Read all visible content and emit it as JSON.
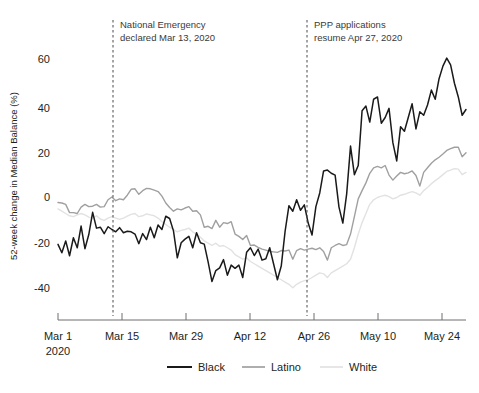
{
  "chart_data": {
    "type": "line",
    "title": "",
    "xlabel": "",
    "ylabel": "52-week change in Median Balance (%)",
    "ylim": [
      -45,
      68
    ],
    "yticks": [
      -40,
      -20,
      0,
      20,
      40,
      60
    ],
    "ytick_labels": [
      "-40",
      "-20",
      "0",
      "20",
      "40",
      "60"
    ],
    "xticks": [
      "Mar 1",
      "Mar 15",
      "Mar 29",
      "Apr 12",
      "Apr 26",
      "May 10",
      "May 24"
    ],
    "xtick_sublabel": "2020",
    "grid": false,
    "legend_position": "bottom",
    "x_start_date": "2020-03-01",
    "x_end_date": "2020-05-31",
    "annotations": [
      {
        "name": "national-emergency",
        "line1": "National Emergency",
        "line2": "declared Mar 13, 2020",
        "date": "2020-03-13"
      },
      {
        "name": "ppp-applications",
        "line1": "PPP applications",
        "line2": "resume Apr 27, 2020",
        "date": "2020-04-27"
      }
    ],
    "series": [
      {
        "name": "Black",
        "color": "#1a1a1a",
        "width": 1.5,
        "values": [
          -20.5,
          -24.2,
          -19.0,
          -25.5,
          -17.6,
          -22.0,
          -12.5,
          -22.4,
          -16.2,
          -6.5,
          -13.4,
          -13.0,
          -15.8,
          -12.8,
          -14.0,
          -15.0,
          -13.2,
          -15.4,
          -14.8,
          -15.0,
          -16.0,
          -20.2,
          -15.8,
          -18.4,
          -13.0,
          -17.6,
          -12.0,
          -14.0,
          -8.2,
          -9.2,
          -14.6,
          -26.4,
          -19.8,
          -18.2,
          -17.0,
          -22.0,
          -15.4,
          -19.8,
          -20.4,
          -28.2,
          -36.8,
          -32.0,
          -30.8,
          -27.2,
          -34.0,
          -29.6,
          -31.0,
          -29.6,
          -35.0,
          -24.0,
          -22.0,
          -25.4,
          -22.6,
          -27.4,
          -26.8,
          -22.0,
          -29.0,
          -36.0,
          -30.0,
          -14.8,
          -3.6,
          -6.0,
          -1.0,
          -5.6,
          -3.2,
          -11.2,
          -16.4,
          -4.0,
          2.0,
          11.6,
          12.0,
          10.6,
          9.8,
          -4.2,
          -11.2,
          1.6,
          22.5,
          10.0,
          14.0,
          38.0,
          40.0,
          33.0,
          43.0,
          44.0,
          32.5,
          35.0,
          39.0,
          24.0,
          16.0,
          31.0,
          29.0,
          35.0,
          41.0,
          30.0,
          37.5,
          36.0,
          40.5,
          47.0,
          43.0,
          52.0,
          57.5,
          61.0,
          58.0,
          50.0,
          44.0,
          36.0,
          38.5
        ]
      },
      {
        "name": "Latino",
        "color": "#a0a0a0",
        "width": 1.4,
        "values": [
          -2.2,
          -2.4,
          -3.0,
          -6.6,
          -6.6,
          -7.0,
          -4.2,
          -3.0,
          -4.0,
          -3.8,
          -3.0,
          -4.2,
          -4.0,
          -1.0,
          0.2,
          -1.4,
          -0.6,
          -1.0,
          1.0,
          3.6,
          3.8,
          1.4,
          3.0,
          4.0,
          3.8,
          3.2,
          2.6,
          0.6,
          -2.4,
          -4.4,
          -6.0,
          -5.0,
          -5.4,
          -4.6,
          -4.0,
          -6.0,
          -5.8,
          -7.6,
          -13.0,
          -12.6,
          -13.6,
          -10.0,
          -13.0,
          -11.0,
          -11.4,
          -10.6,
          -16.0,
          -17.0,
          -18.4,
          -16.6,
          -21.0,
          -20.8,
          -21.8,
          -22.6,
          -23.0,
          -23.6,
          -23.8,
          -24.0,
          -23.2,
          -23.4,
          -23.0,
          -27.0,
          -23.2,
          -22.4,
          -23.0,
          -22.6,
          -22.2,
          -22.8,
          -22.0,
          -23.6,
          -27.4,
          -22.0,
          -21.0,
          -20.2,
          -21.0,
          -20.6,
          -16.0,
          -8.4,
          -0.6,
          3.0,
          6.4,
          10.6,
          13.0,
          13.6,
          13.0,
          14.0,
          9.8,
          7.6,
          9.4,
          11.0,
          10.4,
          10.8,
          11.6,
          9.6,
          5.0,
          11.0,
          13.0,
          15.0,
          16.5,
          17.6,
          19.0,
          20.6,
          21.4,
          22.0,
          22.0,
          17.8,
          19.6
        ]
      },
      {
        "name": "White",
        "color": "#e2e2e2",
        "width": 1.4,
        "values": [
          -5.0,
          -6.0,
          -7.0,
          -8.0,
          -8.4,
          -7.6,
          -7.0,
          -7.6,
          -8.6,
          -9.0,
          -8.0,
          -9.4,
          -10.0,
          -9.0,
          -8.4,
          -9.0,
          -9.6,
          -9.0,
          -8.2,
          -7.4,
          -7.0,
          -8.4,
          -8.0,
          -7.2,
          -7.6,
          -8.0,
          -9.0,
          -10.6,
          -11.8,
          -13.0,
          -14.0,
          -15.0,
          -14.4,
          -14.0,
          -13.4,
          -15.0,
          -16.0,
          -17.4,
          -19.0,
          -20.0,
          -21.0,
          -20.0,
          -21.4,
          -21.0,
          -22.0,
          -23.0,
          -25.0,
          -26.0,
          -27.0,
          -26.4,
          -28.0,
          -29.0,
          -30.0,
          -31.0,
          -32.0,
          -33.0,
          -34.0,
          -35.0,
          -36.0,
          -37.0,
          -38.0,
          -39.5,
          -38.0,
          -37.0,
          -36.4,
          -36.0,
          -35.0,
          -34.0,
          -33.0,
          -33.4,
          -35.0,
          -33.0,
          -32.0,
          -31.0,
          -30.0,
          -29.0,
          -27.0,
          -22.0,
          -16.0,
          -11.0,
          -7.0,
          -3.0,
          -1.0,
          0.0,
          0.6,
          1.0,
          0.4,
          -0.6,
          0.0,
          1.0,
          1.4,
          2.0,
          2.6,
          2.0,
          1.0,
          3.0,
          4.4,
          6.0,
          7.4,
          8.6,
          10.0,
          11.4,
          12.0,
          12.6,
          12.4,
          10.0,
          11.0
        ]
      }
    ],
    "legend": [
      {
        "label": "Black",
        "color": "#1a1a1a"
      },
      {
        "label": "Latino",
        "color": "#a0a0a0"
      },
      {
        "label": "White",
        "color": "#e2e2e2"
      }
    ]
  }
}
